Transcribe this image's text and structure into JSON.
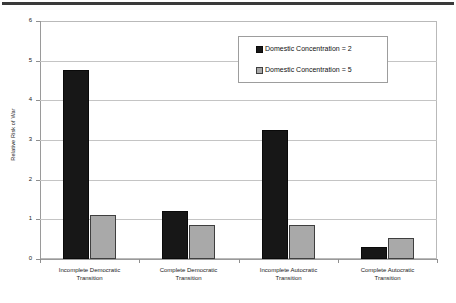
{
  "chart_data": {
    "type": "bar",
    "title": "",
    "xlabel": "",
    "ylabel": "Relative Risk of War",
    "ylim": [
      0,
      6
    ],
    "yticks": [
      "0",
      "1",
      "2",
      "3",
      "4",
      "5",
      "6"
    ],
    "grid": true,
    "legend_position": "upper right",
    "categories": [
      "Incomplete Democratic Transition",
      "Complete Democratic Transition",
      "Incomplete Autocratic Transition",
      "Complete Autocratic Transition"
    ],
    "category_lines": [
      [
        "Incomplete Democratic",
        "Transition"
      ],
      [
        "Complete Democratic",
        "Transition"
      ],
      [
        "Incomplete Autocratic",
        "Transition"
      ],
      [
        "Complete Autocratic",
        "Transition"
      ]
    ],
    "series": [
      {
        "name": "Domestic Concentration = 2",
        "color": "#171717",
        "values": [
          4.77,
          1.22,
          3.25,
          0.29
        ]
      },
      {
        "name": "Domestic Concentration = 5",
        "color": "#a9a9a9",
        "values": [
          1.12,
          0.85,
          0.86,
          0.53
        ]
      }
    ]
  },
  "legend": {
    "items": [
      {
        "label": "Domestic Concentration = 2",
        "swatch": "black-square-icon"
      },
      {
        "label": "Domestic Concentration = 5",
        "swatch": "gray-square-icon"
      }
    ]
  }
}
